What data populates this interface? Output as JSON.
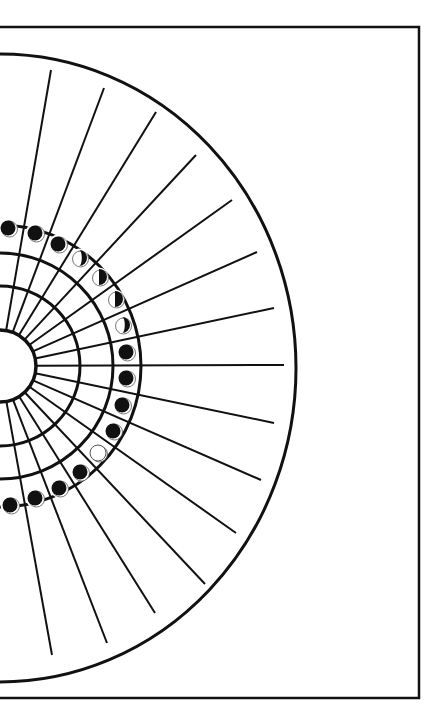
{
  "diagram": {
    "title": "",
    "type": "moon-phase-tracker",
    "colors": {
      "ink": "#111111",
      "paper": "#ffffff",
      "moon_outline": "#555555"
    },
    "frame": {
      "top": 27,
      "right": 419,
      "bottom": 698,
      "left": 0
    },
    "center": {
      "x": 0,
      "y": 366
    },
    "hub_radius": 36,
    "rings": [
      {
        "name": "inner-ring",
        "r": 80
      },
      {
        "name": "middle-ring",
        "r": 113
      },
      {
        "name": "moon-ring-outer",
        "r": 141
      }
    ],
    "outer_boundary": {
      "rx": 296,
      "ry": 314,
      "cy": 368
    },
    "rays": [
      {
        "angle": -80,
        "end": [
          51,
          70
        ]
      },
      {
        "angle": -70,
        "end": [
          104,
          88
        ]
      },
      {
        "angle": -59,
        "end": [
          156,
          112
        ]
      },
      {
        "angle": -48,
        "end": [
          196,
          155
        ]
      },
      {
        "angle": -37,
        "end": [
          232,
          200
        ]
      },
      {
        "angle": -26,
        "end": [
          257,
          252
        ]
      },
      {
        "angle": -13,
        "end": [
          274,
          308
        ]
      },
      {
        "angle": 0,
        "end": [
          284,
          365
        ]
      },
      {
        "angle": 12,
        "end": [
          274,
          423
        ]
      },
      {
        "angle": 24,
        "end": [
          261,
          480
        ]
      },
      {
        "angle": 36,
        "end": [
          236,
          533
        ]
      },
      {
        "angle": 48,
        "end": [
          205,
          584
        ]
      },
      {
        "angle": 59,
        "end": [
          155,
          613
        ]
      },
      {
        "angle": 70,
        "end": [
          107,
          643
        ]
      },
      {
        "angle": 81,
        "end": [
          52,
          655
        ]
      }
    ],
    "moons": [
      {
        "x": 8,
        "y": 228,
        "phase": "new"
      },
      {
        "x": 35,
        "y": 233,
        "phase": "new"
      },
      {
        "x": 58,
        "y": 244,
        "phase": "new"
      },
      {
        "x": 79,
        "y": 258,
        "phase": "waxing-crescent"
      },
      {
        "x": 99,
        "y": 277,
        "phase": "first-quarter"
      },
      {
        "x": 115,
        "y": 299,
        "phase": "first-quarter"
      },
      {
        "x": 122,
        "y": 325,
        "phase": "waxing-crescent"
      },
      {
        "x": 126,
        "y": 352,
        "phase": "new"
      },
      {
        "x": 126,
        "y": 378,
        "phase": "new"
      },
      {
        "x": 122,
        "y": 405,
        "phase": "new"
      },
      {
        "x": 113,
        "y": 431,
        "phase": "new"
      },
      {
        "x": 98,
        "y": 453,
        "phase": "full"
      },
      {
        "x": 80,
        "y": 472,
        "phase": "new"
      },
      {
        "x": 59,
        "y": 488,
        "phase": "new"
      },
      {
        "x": 35,
        "y": 498,
        "phase": "new"
      },
      {
        "x": 10,
        "y": 505,
        "phase": "new"
      }
    ]
  }
}
